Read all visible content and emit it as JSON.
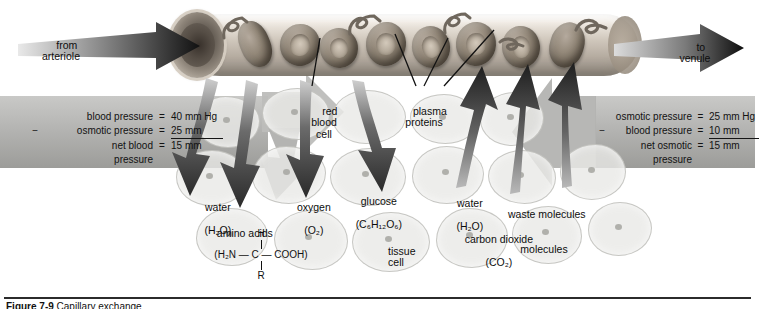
{
  "figure": {
    "caption_number": "Figure 7-9",
    "caption_text": "Capillary exchange"
  },
  "flow": {
    "inlet_label": "from\narteriole",
    "outlet_label": "to\nvenule"
  },
  "capillary": {
    "red_blood_cell_label": "red\nblood\ncell",
    "plasma_proteins_label": "plasma\nproteins"
  },
  "tissue": {
    "tissue_cell_label": "tissue\ncell"
  },
  "pressure_left": {
    "title": "net blood pressure",
    "rows": [
      {
        "sign": "",
        "name": "blood pressure",
        "eq": "=",
        "value": "40 mm Hg"
      },
      {
        "sign": "−",
        "name": "osmotic pressure",
        "eq": "=",
        "value": "25 mm"
      },
      {
        "sign": "",
        "name": "net blood\n  pressure",
        "eq": "=",
        "value": "15 mm"
      }
    ]
  },
  "pressure_right": {
    "title": "net osmotic pressure",
    "rows": [
      {
        "sign": "",
        "name": "osmotic pressure",
        "eq": "=",
        "value": "25 mm Hg"
      },
      {
        "sign": "−",
        "name": "blood pressure",
        "eq": "=",
        "value": "10 mm"
      },
      {
        "sign": "",
        "name": "net osmotic\n  pressure",
        "eq": "=",
        "value": "15 mm"
      }
    ]
  },
  "outflow_substances": [
    {
      "name": "water",
      "formula": "(H₂O)"
    },
    {
      "name": "amino acids",
      "formula": ""
    },
    {
      "name": "oxygen",
      "formula": "(O₂)"
    },
    {
      "name": "glucose",
      "formula": "(C₆H₁₂O₆)"
    }
  ],
  "inflow_substances": [
    {
      "name": "water",
      "formula": "(H₂O)"
    },
    {
      "name": "carbon dioxide",
      "formula": "(CO₂)"
    },
    {
      "name": "waste molecules",
      "formula": ""
    }
  ],
  "amino_acid_structure": {
    "top": "H",
    "middle": "(H₂N — C — COOH)",
    "bottom": "R"
  },
  "colors": {
    "banner_gray": "#b3b3b1",
    "arrow_dark": "#3a3a3a",
    "tissue_fill": "#e8e8e6",
    "page_bg": "#ffffff"
  }
}
